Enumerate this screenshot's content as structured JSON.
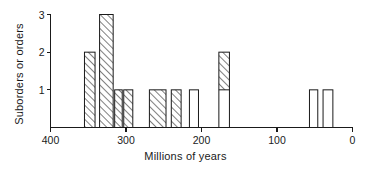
{
  "chart_data": {
    "type": "bar",
    "title": "",
    "xlabel": "Millions of years",
    "ylabel": "Suborders or orders",
    "xlim": [
      400,
      0
    ],
    "ylim": [
      0,
      3
    ],
    "x_reversed": true,
    "grid": false,
    "legend": null,
    "x_ticks": [
      "400",
      "300",
      "200",
      "100",
      "0"
    ],
    "x_tick_values": [
      400,
      300,
      200,
      100,
      0
    ],
    "y_ticks": [
      "1",
      "2",
      "3"
    ],
    "y_tick_values": [
      1,
      2,
      3
    ],
    "bars": [
      {
        "label": "bar-348",
        "x_start": 355,
        "x_end": 341,
        "value": 2,
        "hatched_value": 2,
        "plain_value": 0,
        "fill": "hatched"
      },
      {
        "label": "bar-328",
        "x_start": 335,
        "x_end": 317,
        "value": 3,
        "hatched_value": 3,
        "plain_value": 0,
        "fill": "hatched"
      },
      {
        "label": "bar-311",
        "x_start": 315,
        "x_end": 305,
        "value": 1,
        "hatched_value": 1,
        "plain_value": 0,
        "fill": "hatched"
      },
      {
        "label": "bar-299",
        "x_start": 303,
        "x_end": 291,
        "value": 1,
        "hatched_value": 1,
        "plain_value": 0,
        "fill": "hatched"
      },
      {
        "label": "bar-262",
        "x_start": 269,
        "x_end": 247,
        "value": 1,
        "hatched_value": 1,
        "plain_value": 0,
        "fill": "hatched"
      },
      {
        "label": "bar-233",
        "x_start": 240,
        "x_end": 227,
        "value": 1,
        "hatched_value": 1,
        "plain_value": 0,
        "fill": "hatched"
      },
      {
        "label": "bar-207",
        "x_start": 216,
        "x_end": 204,
        "value": 1,
        "hatched_value": 0,
        "plain_value": 1,
        "fill": "plain"
      },
      {
        "label": "bar-174",
        "x_start": 177,
        "x_end": 163,
        "value": 2,
        "hatched_value": 1,
        "plain_value": 1,
        "fill": "stacked"
      },
      {
        "label": "bar-50",
        "x_start": 57,
        "x_end": 46,
        "value": 1,
        "hatched_value": 0,
        "plain_value": 1,
        "fill": "plain"
      },
      {
        "label": "bar-33",
        "x_start": 39,
        "x_end": 26,
        "value": 1,
        "hatched_value": 0,
        "plain_value": 1,
        "fill": "plain"
      }
    ]
  }
}
